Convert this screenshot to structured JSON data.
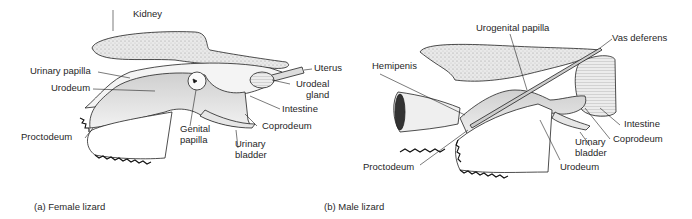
{
  "panels": [
    {
      "id": "female",
      "caption": "(a) Female lizard",
      "labels": {
        "kidney": "Kidney",
        "uterus": "Uterus",
        "urinary_papilla": "Urinary papilla",
        "urodeum": "Urodeum",
        "urodeal_gland_1": "Urodeal",
        "urodeal_gland_2": "gland",
        "intestine": "Intestine",
        "coprodeum": "Coprodeum",
        "genital_papilla_1": "Genital",
        "genital_papilla_2": "papilla",
        "urinary_bladder_1": "Urinary",
        "urinary_bladder_2": "bladder",
        "proctodeum": "Proctodeum"
      }
    },
    {
      "id": "male",
      "caption": "(b) Male lizard",
      "labels": {
        "urogenital_papilla": "Urogenital papilla",
        "vas_deferens": "Vas deferens",
        "hemipenis": "Hemipenis",
        "intestine": "Intestine",
        "coprodeum": "Coprodeum",
        "urinary_bladder_1": "Urinary",
        "urinary_bladder_2": "bladder",
        "urodeum": "Urodeum",
        "proctodeum": "Proctodeum"
      }
    }
  ]
}
